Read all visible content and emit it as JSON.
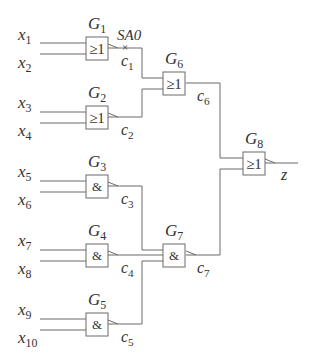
{
  "diagram": {
    "inputs": [
      {
        "name": "x",
        "sub": "1",
        "x": 18,
        "y": 40
      },
      {
        "name": "x",
        "sub": "2",
        "x": 18,
        "y": 68
      },
      {
        "name": "x",
        "sub": "3",
        "x": 18,
        "y": 108
      },
      {
        "name": "x",
        "sub": "4",
        "x": 18,
        "y": 136
      },
      {
        "name": "x",
        "sub": "5",
        "x": 18,
        "y": 177
      },
      {
        "name": "x",
        "sub": "6",
        "x": 18,
        "y": 205
      },
      {
        "name": "x",
        "sub": "7",
        "x": 18,
        "y": 246
      },
      {
        "name": "x",
        "sub": "8",
        "x": 18,
        "y": 274
      },
      {
        "name": "x",
        "sub": "9",
        "x": 18,
        "y": 315
      },
      {
        "name": "x",
        "sub": "10",
        "x": 18,
        "y": 343
      }
    ],
    "gates": [
      {
        "id": "G1",
        "label": "G",
        "sub": "1",
        "type": "OR",
        "symbol": "≥1",
        "x": 86,
        "y": 37
      },
      {
        "id": "G2",
        "label": "G",
        "sub": "2",
        "type": "OR",
        "symbol": "≥1",
        "x": 86,
        "y": 106
      },
      {
        "id": "G3",
        "label": "G",
        "sub": "3",
        "type": "AND",
        "symbol": "&",
        "x": 86,
        "y": 175
      },
      {
        "id": "G4",
        "label": "G",
        "sub": "4",
        "type": "AND",
        "symbol": "&",
        "x": 86,
        "y": 244
      },
      {
        "id": "G5",
        "label": "G",
        "sub": "5",
        "type": "AND",
        "symbol": "&",
        "x": 86,
        "y": 313
      },
      {
        "id": "G6",
        "label": "G",
        "sub": "6",
        "type": "OR",
        "symbol": "≥1",
        "x": 163,
        "y": 72
      },
      {
        "id": "G7",
        "label": "G",
        "sub": "7",
        "type": "AND",
        "symbol": "&",
        "x": 163,
        "y": 244
      },
      {
        "id": "G8",
        "label": "G",
        "sub": "8",
        "type": "OR",
        "symbol": "≥1",
        "x": 243,
        "y": 152
      }
    ],
    "signals": [
      {
        "name": "c",
        "sub": "1",
        "x": 121,
        "y": 66
      },
      {
        "name": "c",
        "sub": "2",
        "x": 121,
        "y": 135
      },
      {
        "name": "c",
        "sub": "3",
        "x": 121,
        "y": 204
      },
      {
        "name": "c",
        "sub": "4",
        "x": 121,
        "y": 273
      },
      {
        "name": "c",
        "sub": "5",
        "x": 121,
        "y": 342
      },
      {
        "name": "c",
        "sub": "6",
        "x": 197,
        "y": 101
      },
      {
        "name": "c",
        "sub": "7",
        "x": 197,
        "y": 273
      }
    ],
    "output": {
      "name": "z",
      "x": 281,
      "y": 180
    },
    "fault": {
      "label": "SA0",
      "x": 117,
      "y": 40,
      "marker": "×"
    }
  }
}
